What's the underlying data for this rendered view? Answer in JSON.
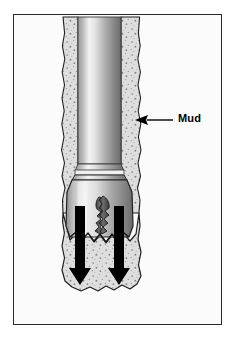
{
  "figure": {
    "kind": "technical-illustration",
    "background_color": "#fbfbfc",
    "frame_color": "#2a2a2a"
  },
  "annotations": [
    {
      "id": "mud",
      "label": "Mud",
      "leader": "arrow-left",
      "text_color": "#000000",
      "target": "borehole-annulus"
    }
  ],
  "diagram": {
    "drill_pipe": {
      "name": "drill-pipe",
      "fill_light": "#f2f2f2",
      "fill_mid": "#b4b4b4",
      "fill_dark": "#6e6e6e"
    },
    "drill_collar": {
      "name": "drill-collar",
      "fill_light": "#ededed",
      "fill_dark": "#757575"
    },
    "drill_bit": {
      "name": "drill-bit-body",
      "fill_light": "#f0f0f0",
      "fill_dark": "#6a6a6a"
    },
    "nozzle_jet": {
      "name": "mud-jet",
      "fill": "#4a4a4a"
    },
    "mud_annulus": {
      "name": "mud-column",
      "fill": "#dcdcdc",
      "speckle": "#8a8a8a",
      "outline": "#1e1e1e"
    },
    "flow_arrows": {
      "name": "mud-flow-arrows",
      "count": 2,
      "direction": "down",
      "fill": "#000000"
    }
  }
}
